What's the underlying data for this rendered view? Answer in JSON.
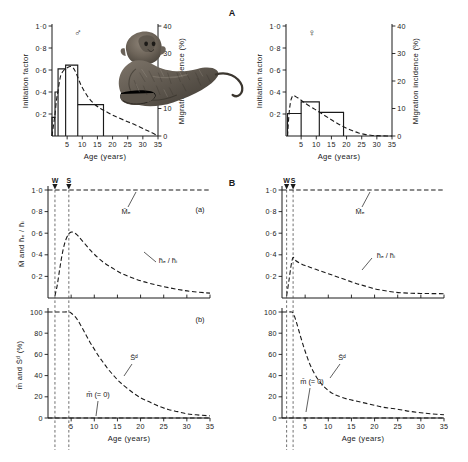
{
  "figure": {
    "panel_letters": {
      "a_group": "A",
      "b_group": "B"
    },
    "subpanel_labels": {
      "a": "(a)",
      "b": "(b)"
    },
    "symbols": {
      "male": "♂",
      "female": "♀"
    },
    "illustration": "macaque-monkey-illustration"
  },
  "axes": {
    "age_label": "Age (years)",
    "age_ticks": [
      "5",
      "10",
      "15",
      "20",
      "25",
      "30",
      "35"
    ],
    "age_tick_values": [
      5,
      10,
      15,
      20,
      25,
      30,
      35
    ],
    "age_range": [
      0,
      35
    ],
    "initiation_label": "Initiation factor",
    "initiation_ticks": [
      "0·2",
      "0·4",
      "0·6",
      "0·8",
      "1·0"
    ],
    "initiation_tick_values": [
      0.2,
      0.4,
      0.6,
      0.8,
      1.0
    ],
    "migration_label": "Migration incidence (%)",
    "migration_ticks": [
      "0",
      "10",
      "20",
      "30",
      "40"
    ],
    "migration_tick_values": [
      0,
      10,
      20,
      30,
      40
    ],
    "mid_y_label": "M̄ and h̄ₑ / h̄ᵢ",
    "mid_y_ticks": [
      "0·2",
      "0·4",
      "0·6",
      "0·8",
      "1·0"
    ],
    "mid_y_tick_values": [
      0.2,
      0.4,
      0.6,
      0.8,
      1.0
    ],
    "bottom_y_label": "m̄ and S̄ᵈ (%)",
    "bottom_y_ticks": [
      "0",
      "20",
      "40",
      "60",
      "80",
      "100"
    ],
    "bottom_y_tick_values": [
      0,
      20,
      40,
      60,
      80,
      100
    ]
  },
  "markers": {
    "weaning_label": "W",
    "sexual_maturity_label": "S",
    "A_weaning_age": 1.5,
    "A_maturity_age": 4.5,
    "B_weaning_age": 1.0,
    "B_maturity_age": 2.4
  },
  "curve_labels": {
    "Mf": "M̄ₑ",
    "hf_hi": "h̄ₑ / h̄ᵢ",
    "Sd": "S̄ᵈ",
    "m_zero": "m̄ (= 0)"
  },
  "chart_data": [
    {
      "id": "male-migration-histogram",
      "type": "bar",
      "title": "Male migration incidence vs age",
      "xlabel": "Age (years)",
      "ylabel": "Initiation factor",
      "y2label": "Migration incidence (%)",
      "xlim": [
        0,
        35
      ],
      "ylim": [
        0,
        1.0
      ],
      "y2lim": [
        0,
        40
      ],
      "grid": false,
      "bins": [
        {
          "x0": 0.0,
          "x1": 1.0,
          "initiation_factor": 0.17
        },
        {
          "x0": 1.0,
          "x1": 2.0,
          "initiation_factor": 0.4
        },
        {
          "x0": 2.0,
          "x1": 4.5,
          "initiation_factor": 0.61
        },
        {
          "x0": 4.5,
          "x1": 8.5,
          "initiation_factor": 0.645
        },
        {
          "x0": 8.5,
          "x1": 17.0,
          "initiation_factor": 0.285
        }
      ],
      "fitted_curve": {
        "name": "model-fit",
        "style": "dashed",
        "x": [
          0,
          0.5,
          1,
          1.5,
          2,
          2.5,
          3,
          4,
          5,
          6,
          7,
          8,
          9,
          10,
          12,
          14,
          16,
          18,
          20,
          22,
          25,
          28,
          31,
          33,
          35
        ],
        "y": [
          0.0,
          0.1,
          0.2,
          0.33,
          0.41,
          0.5,
          0.56,
          0.6,
          0.62,
          0.632,
          0.62,
          0.57,
          0.5,
          0.44,
          0.35,
          0.29,
          0.25,
          0.22,
          0.19,
          0.165,
          0.13,
          0.095,
          0.055,
          0.03,
          0.0
        ]
      }
    },
    {
      "id": "female-migration-histogram",
      "type": "bar",
      "title": "Female migration incidence vs age",
      "xlabel": "Age (years)",
      "ylabel": "Initiation factor",
      "y2label": "Migration incidence (%)",
      "xlim": [
        0,
        35
      ],
      "ylim": [
        0,
        1.0
      ],
      "y2lim": [
        0,
        40
      ],
      "grid": false,
      "bins": [
        {
          "x0": 0.5,
          "x1": 5.0,
          "initiation_factor": 0.205
        },
        {
          "x0": 5.0,
          "x1": 11.0,
          "initiation_factor": 0.31
        },
        {
          "x0": 11.0,
          "x1": 19.0,
          "initiation_factor": 0.215
        }
      ],
      "fitted_curve": {
        "name": "model-fit",
        "style": "dashed",
        "x": [
          0.5,
          1,
          1.5,
          2,
          2.5,
          3,
          4,
          5,
          6,
          8,
          10,
          12,
          14,
          16,
          18,
          20,
          22,
          24,
          26,
          28,
          30,
          32,
          35
        ],
        "y": [
          0.0,
          0.2,
          0.31,
          0.355,
          0.368,
          0.362,
          0.345,
          0.325,
          0.305,
          0.268,
          0.235,
          0.2,
          0.165,
          0.13,
          0.098,
          0.07,
          0.047,
          0.028,
          0.015,
          0.007,
          0.003,
          0.001,
          0.0
        ]
      }
    },
    {
      "id": "A-panel-a-survival-factors",
      "type": "line",
      "title": "Group A (a)",
      "xlabel": "Age (years)",
      "ylabel": "M̄ and h̄ₑ / h̄ᵢ",
      "xlim": [
        0,
        35
      ],
      "ylim": [
        0,
        1.0
      ],
      "grid": false,
      "series": [
        {
          "name": "M̄ₑ",
          "style": "dashed",
          "x": [
            0,
            35
          ],
          "y": [
            1.0,
            1.0
          ]
        },
        {
          "name": "h̄ₑ / h̄ᵢ",
          "style": "dashed",
          "x": [
            1.5,
            2,
            2.5,
            3,
            3.5,
            4,
            4.5,
            5,
            5.5,
            6,
            6.5,
            7,
            8,
            9,
            10,
            12,
            14,
            16,
            18,
            20,
            22,
            25,
            28,
            31,
            35
          ],
          "y": [
            0.02,
            0.12,
            0.26,
            0.39,
            0.49,
            0.555,
            0.595,
            0.61,
            0.608,
            0.595,
            0.575,
            0.55,
            0.5,
            0.45,
            0.405,
            0.33,
            0.275,
            0.225,
            0.19,
            0.16,
            0.135,
            0.105,
            0.08,
            0.06,
            0.045
          ]
        }
      ]
    },
    {
      "id": "A-panel-b-mortality-survival",
      "type": "line",
      "title": "Group A (b)",
      "xlabel": "Age (years)",
      "ylabel": "m̄ and S̄ᵈ (%)",
      "xlim": [
        0,
        35
      ],
      "ylim": [
        0,
        100
      ],
      "grid": false,
      "series": [
        {
          "name": "S̄ᵈ",
          "style": "dashed",
          "x": [
            0,
            1.5,
            3,
            4.5,
            5,
            6,
            7,
            8,
            9,
            10,
            11,
            12,
            13,
            14,
            15,
            16,
            18,
            20,
            22,
            24,
            26,
            28,
            30,
            32,
            35
          ],
          "y": [
            100,
            100,
            100,
            100,
            99,
            95,
            88,
            80,
            72,
            65,
            58,
            52,
            46,
            41,
            36,
            32,
            25,
            19,
            15,
            11,
            8,
            6,
            4,
            3,
            2
          ]
        },
        {
          "name": "m̄ (= 0)",
          "style": "dashed",
          "x": [
            0,
            35
          ],
          "y": [
            0,
            0
          ]
        }
      ]
    },
    {
      "id": "B-panel-a-survival-factors",
      "type": "line",
      "title": "Group B (a)",
      "xlabel": "Age (years)",
      "ylabel": "M̄ and h̄ₑ / h̄ᵢ",
      "xlim": [
        0,
        35
      ],
      "ylim": [
        0,
        1.0
      ],
      "grid": false,
      "series": [
        {
          "name": "M̄ₑ",
          "style": "dashed",
          "x": [
            0,
            35
          ],
          "y": [
            1.0,
            1.0
          ]
        },
        {
          "name": "h̄ₑ / h̄ᵢ",
          "style": "dashed",
          "x": [
            1.0,
            1.5,
            2,
            2.4,
            3,
            4,
            5,
            6,
            8,
            10,
            12,
            14,
            16,
            18,
            20,
            22,
            24,
            26,
            28,
            30,
            32,
            35
          ],
          "y": [
            0.02,
            0.16,
            0.31,
            0.375,
            0.345,
            0.32,
            0.3,
            0.285,
            0.255,
            0.225,
            0.195,
            0.165,
            0.135,
            0.11,
            0.085,
            0.07,
            0.055,
            0.048,
            0.044,
            0.042,
            0.041,
            0.04
          ]
        }
      ]
    },
    {
      "id": "B-panel-b-mortality-survival",
      "type": "line",
      "title": "Group B (b)",
      "xlabel": "Age (years)",
      "ylabel": "m̄ and S̄ᵈ (%)",
      "xlim": [
        0,
        100
      ],
      "ylim": [
        0,
        100
      ],
      "grid": false,
      "series": [
        {
          "name": "S̄ᵈ",
          "style": "dashed",
          "x": [
            0,
            1,
            2,
            2.4,
            3,
            4,
            5,
            6,
            7,
            8,
            9,
            10,
            11,
            12,
            14,
            16,
            18,
            20,
            22,
            24,
            26,
            28,
            30,
            32,
            35
          ],
          "y": [
            100,
            100,
            100,
            99,
            92,
            77,
            63,
            51,
            42,
            35,
            30,
            26,
            23,
            21,
            18,
            16,
            14,
            12,
            10,
            9,
            7.5,
            6,
            5,
            4,
            3
          ]
        },
        {
          "name": "m̄ (= 0)",
          "style": "dashed",
          "x": [
            0,
            35
          ],
          "y": [
            0,
            0
          ]
        }
      ]
    }
  ]
}
